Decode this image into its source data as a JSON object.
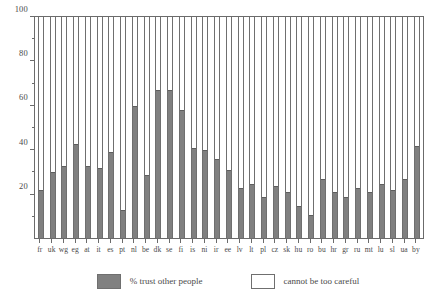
{
  "chart_data": {
    "type": "bar",
    "title": "",
    "subtitle": "",
    "xlabel": "",
    "ylabel": "",
    "ylim": [
      0,
      100
    ],
    "grid": false,
    "stacked": true,
    "stack_total": 100,
    "legend_position": "bottom",
    "y_major_ticks": [
      20,
      40,
      60,
      80,
      100
    ],
    "y_major_labels": [
      "20",
      "40",
      "60",
      "80",
      "100"
    ],
    "y_minor_ticks": [
      10,
      30,
      50,
      70,
      90
    ],
    "categories": [
      "fr",
      "uk",
      "wg",
      "eg",
      "at",
      "it",
      "es",
      "pt",
      "nl",
      "be",
      "dk",
      "se",
      "fi",
      "is",
      "ni",
      "ir",
      "ee",
      "lv",
      "lt",
      "pl",
      "cz",
      "sk",
      "hu",
      "ro",
      "bu",
      "hr",
      "gr",
      "ru",
      "mt",
      "lu",
      "sl",
      "ua",
      "by"
    ],
    "series": [
      {
        "name": "% trust other people",
        "color": "#808080",
        "values": [
          22,
          30,
          33,
          43,
          33,
          32,
          39,
          13,
          60,
          29,
          67,
          67,
          58,
          41,
          40,
          36,
          31,
          23,
          25,
          19,
          24,
          21,
          15,
          11,
          27,
          21,
          19,
          23,
          21,
          25,
          22,
          27,
          42
        ]
      },
      {
        "name": "cannot be too careful",
        "color": "#ffffff",
        "values": [
          78,
          70,
          67,
          57,
          67,
          68,
          61,
          87,
          40,
          71,
          33,
          33,
          42,
          59,
          60,
          64,
          69,
          77,
          75,
          81,
          76,
          79,
          85,
          89,
          73,
          79,
          81,
          77,
          79,
          75,
          78,
          73,
          58
        ]
      }
    ]
  },
  "legend": {
    "entries": [
      {
        "label": "% trust other people",
        "style": "filled"
      },
      {
        "label": "cannot be too careful",
        "style": "empty"
      }
    ]
  }
}
